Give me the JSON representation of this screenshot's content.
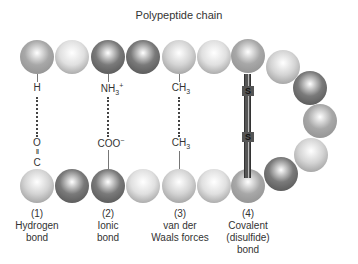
{
  "title": "Polypeptide chain",
  "colors": {
    "light": "#d4d4d4",
    "pale": "#e0e0e0",
    "medium": "#a8a8a8",
    "dark": "#7a7a7a"
  },
  "top_beads": [
    {
      "x": 37,
      "y": 57,
      "tone": "medium"
    },
    {
      "x": 72,
      "y": 57,
      "tone": "pale"
    },
    {
      "x": 108,
      "y": 57,
      "tone": "dark"
    },
    {
      "x": 143,
      "y": 57,
      "tone": "dark"
    },
    {
      "x": 179,
      "y": 57,
      "tone": "light"
    },
    {
      "x": 214,
      "y": 57,
      "tone": "pale"
    },
    {
      "x": 248,
      "y": 56,
      "tone": "medium"
    }
  ],
  "curve_beads": [
    {
      "x": 283,
      "y": 67,
      "tone": "light"
    },
    {
      "x": 310,
      "y": 88,
      "tone": "dark"
    },
    {
      "x": 320,
      "y": 121,
      "tone": "medium"
    },
    {
      "x": 311,
      "y": 155,
      "tone": "light"
    },
    {
      "x": 281,
      "y": 174,
      "tone": "dark"
    }
  ],
  "bottom_beads": [
    {
      "x": 37,
      "y": 186,
      "tone": "light"
    },
    {
      "x": 72,
      "y": 186,
      "tone": "dark"
    },
    {
      "x": 108,
      "y": 186,
      "tone": "dark"
    },
    {
      "x": 143,
      "y": 186,
      "tone": "pale"
    },
    {
      "x": 179,
      "y": 186,
      "tone": "light"
    },
    {
      "x": 214,
      "y": 186,
      "tone": "pale"
    },
    {
      "x": 248,
      "y": 186,
      "tone": "medium"
    }
  ],
  "bonds": [
    {
      "number": "(1)",
      "name_line1": "Hydrogen",
      "name_line2": "bond",
      "name_line3": "",
      "top_group": "H",
      "bottom_group_1": "O",
      "bottom_group_2": "II",
      "bottom_group_3": "C"
    },
    {
      "number": "(2)",
      "name_line1": "Ionic",
      "name_line2": "bond",
      "name_line3": "",
      "top_group_main": "NH",
      "top_group_sub": "3",
      "top_group_sup": "+",
      "bottom_group_main": "COO",
      "bottom_group_sup": "−"
    },
    {
      "number": "(3)",
      "name_line1": "van der",
      "name_line2": "Waals forces",
      "name_line3": "",
      "top_group_main": "CH",
      "top_group_sub": "3",
      "bottom_group_main": "CH",
      "bottom_group_sub": "3"
    },
    {
      "number": "(4)",
      "name_line1": "Covalent",
      "name_line2": "(disulfide)",
      "name_line3": "bond",
      "top_group": "S",
      "bottom_group": "S"
    }
  ]
}
